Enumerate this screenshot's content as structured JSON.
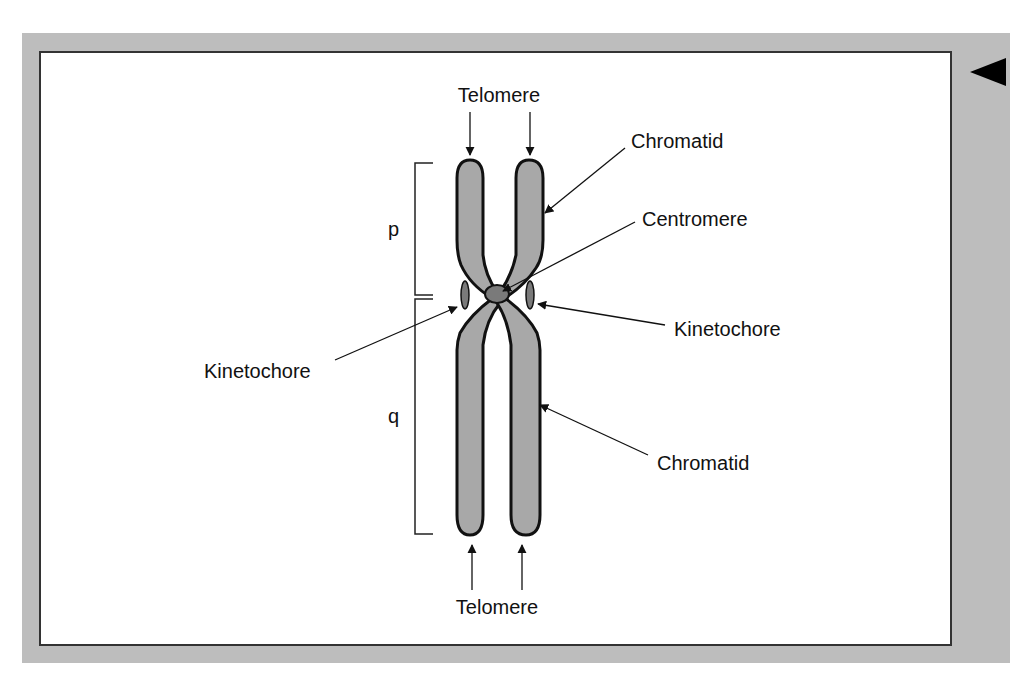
{
  "diagram": {
    "labels": {
      "telomere_top": "Telomere",
      "telomere_bottom": "Telomere",
      "chromatid_top": "Chromatid",
      "centromere": "Centromere",
      "kinetochore_left": "Kinetochore",
      "kinetochore_right": "Kinetochore",
      "chromatid_bottom": "Chromatid",
      "p_arm": "p",
      "q_arm": "q"
    },
    "nav": {
      "back_icon": "triangle-left-icon"
    },
    "colors": {
      "frame": "#bdbdbd",
      "chromatid_fill": "#a8a8a8",
      "centromere_fill": "#7a7a7a",
      "outline": "#111111"
    }
  }
}
